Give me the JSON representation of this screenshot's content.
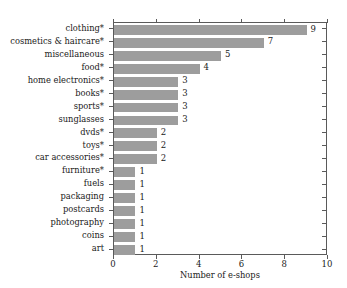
{
  "chart_data": {
    "type": "bar",
    "orientation": "horizontal",
    "title": "",
    "xlabel": "Number of e-shops",
    "ylabel": "",
    "xlim": [
      0,
      10
    ],
    "xticks": [
      0,
      2,
      4,
      6,
      8,
      10
    ],
    "xtick_labels": [
      "0",
      "2",
      "4",
      "6",
      "8",
      "10"
    ],
    "grid": false,
    "legend": null,
    "bar_color": "#9d9d9d",
    "axis_color": "#5a5a5a",
    "background_color": "#ffffff",
    "show_value_labels": true,
    "categories": [
      "clothing*",
      "cosmetics & haircare*",
      "miscellaneous",
      "food*",
      "home electronics*",
      "books*",
      "sports*",
      "sunglasses",
      "dvds*",
      "toys*",
      "car accessories*",
      "furniture*",
      "fuels",
      "packaging",
      "postcards",
      "photography",
      "coins",
      "art"
    ],
    "values": [
      9,
      7,
      5,
      4,
      3,
      3,
      3,
      3,
      2,
      2,
      2,
      1,
      1,
      1,
      1,
      1,
      1,
      1
    ],
    "value_labels": [
      "9",
      "7",
      "5",
      "4",
      "3",
      "3",
      "3",
      "3",
      "2",
      "2",
      "2",
      "1",
      "1",
      "1",
      "1",
      "1",
      "1",
      "1"
    ]
  }
}
